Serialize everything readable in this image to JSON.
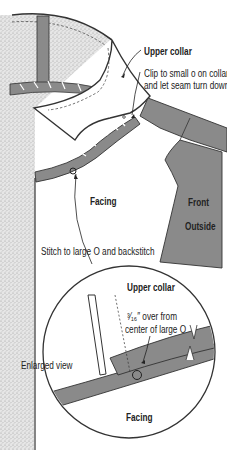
{
  "labels": {
    "upper_collar": "Upper collar",
    "clip_line1": "Clip to small o on collar",
    "clip_line2": "and let seam turn down",
    "facing": "Facing",
    "front": "Front",
    "outside": "Outside",
    "stitch": "Stitch to large O and backstitch",
    "enlarged_upper_collar": "Upper collar",
    "measure_line1": "³⁄₁₆″ over from",
    "measure_line2": "center of large O",
    "enlarged_view": "Enlarged view",
    "enlarged_facing": "Facing"
  },
  "colors": {
    "fabric_gray": "#8a8a8a",
    "stipple_bg": "#d9d9d9",
    "outline": "#333333",
    "paper": "#ffffff"
  }
}
